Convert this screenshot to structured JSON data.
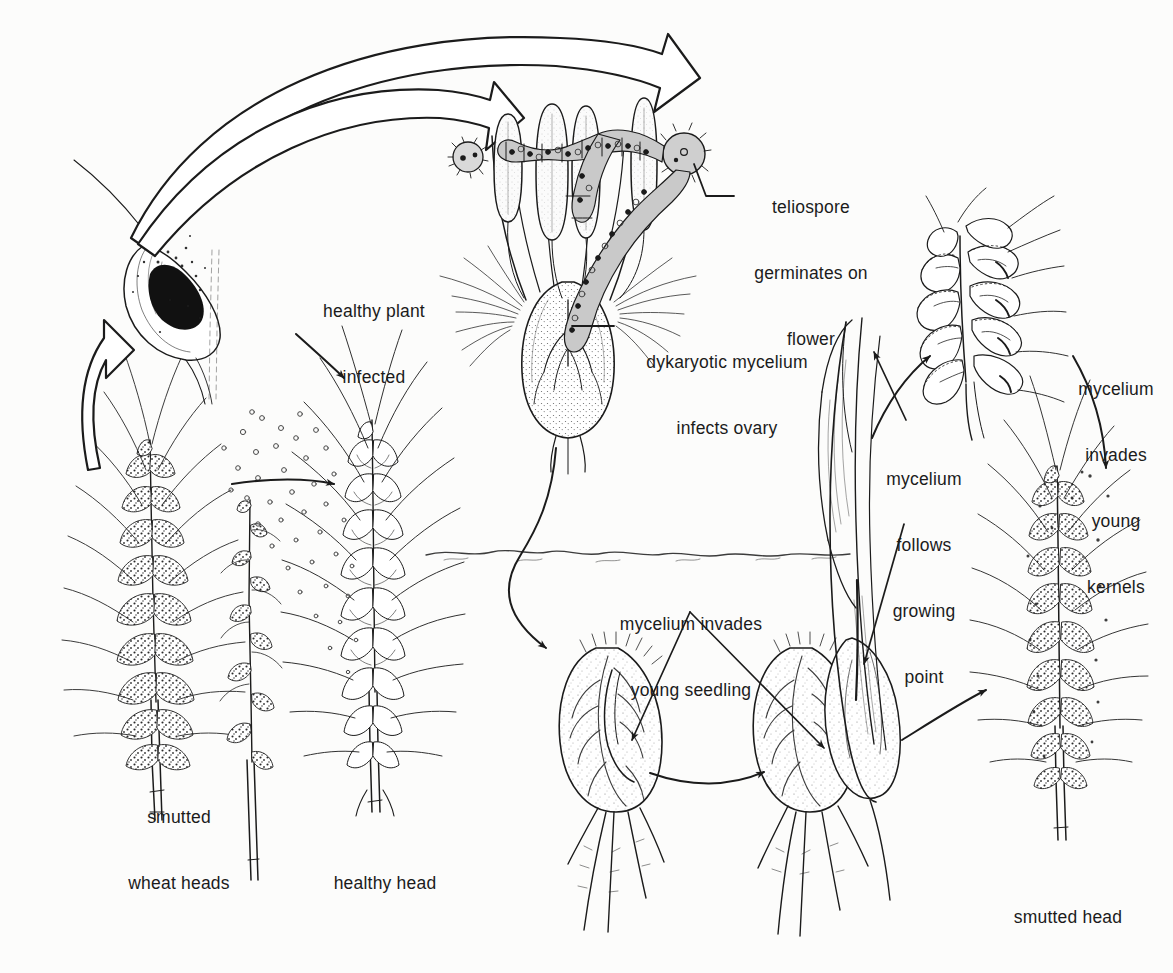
{
  "figure": {
    "background_color": "#fcfcfb",
    "ink_color": "#1b1b1b",
    "type": "disease-cycle diagram",
    "style": "pen-and-ink scientific illustration"
  },
  "labels": {
    "teliospore": {
      "lines": [
        "teliospore",
        "germinates on",
        "flower"
      ],
      "align": "center"
    },
    "dykaryotic": {
      "lines": [
        "dykaryotic mycelium",
        "infects ovary"
      ],
      "align": "center"
    },
    "kernels": {
      "lines": [
        "mycelium",
        "invades",
        "young",
        "kernels"
      ],
      "align": "center"
    },
    "growing_point": {
      "lines": [
        "mycelium",
        "follows",
        "growing",
        "point"
      ],
      "align": "center"
    },
    "seedling": {
      "lines": [
        "mycelium invades",
        "young seedling"
      ],
      "align": "center"
    },
    "healthy_plant_infected": {
      "lines": [
        "healthy plant",
        "infected"
      ],
      "align": "center"
    },
    "smutted_wheat_heads": {
      "lines": [
        "smutted",
        "wheat heads"
      ],
      "align": "center"
    },
    "healthy_head": {
      "lines": [
        "healthy head"
      ],
      "align": "center"
    },
    "smutted_head": {
      "lines": [
        "smutted head"
      ],
      "align": "center"
    }
  },
  "illustrations": [
    {
      "name": "smutted-wheat-head-left",
      "caption": "smutted wheat heads"
    },
    {
      "name": "bare-rachis-head",
      "caption": "smutted wheat heads"
    },
    {
      "name": "healthy-wheat-head",
      "caption": "healthy head"
    },
    {
      "name": "smutted-floret-releasing-spores",
      "caption": "spore release"
    },
    {
      "name": "wheat-flower-with-teliospore",
      "caption": "teliospore germinates on flower"
    },
    {
      "name": "infected-ovary",
      "caption": "dykaryotic mycelium infects ovary"
    },
    {
      "name": "young-kernel-cluster",
      "caption": "mycelium invades young kernels"
    },
    {
      "name": "germinating-seed-left",
      "caption": "mycelium invades young seedling"
    },
    {
      "name": "germinating-seed-right",
      "caption": "mycelium follows growing point"
    },
    {
      "name": "smutted-wheat-head-right",
      "caption": "smutted head"
    },
    {
      "name": "soil-line",
      "caption": "soil surface"
    }
  ],
  "arrows": [
    {
      "name": "arrow-spores-to-flower-outer",
      "style": "outlined-block",
      "from": "smutted-floret",
      "to": "wheat-flower"
    },
    {
      "name": "arrow-spores-to-flower-inner",
      "style": "outlined-block",
      "from": "smutted-floret",
      "to": "wheat-flower"
    },
    {
      "name": "arrow-up-to-floret",
      "style": "outlined-block",
      "from": "smutted-heads",
      "to": "smutted-floret"
    },
    {
      "name": "arrow-spore-drift-upper",
      "style": "thin-line",
      "from": "spore-cloud",
      "to": "healthy-head"
    },
    {
      "name": "arrow-spore-drift-lower",
      "style": "thin-line",
      "from": "spore-cloud",
      "to": "healthy-head"
    },
    {
      "name": "arrow-ovary-to-seedling",
      "style": "thin-line",
      "from": "infected-ovary",
      "to": "germinating-seed-left"
    },
    {
      "name": "arrow-seed-to-seed",
      "style": "thin-line",
      "from": "germinating-seed-left",
      "to": "germinating-seed-right"
    },
    {
      "name": "arrow-seed-to-smutted-head",
      "style": "thin-line",
      "from": "germinating-seed-right",
      "to": "smutted-head-right"
    },
    {
      "name": "arrow-to-kernels",
      "style": "thin-line",
      "from": "growing-point",
      "to": "young-kernel-cluster"
    },
    {
      "name": "arrow-kernels-down",
      "style": "thin-line",
      "from": "young-kernel-cluster",
      "to": "smutted-head-right"
    }
  ]
}
